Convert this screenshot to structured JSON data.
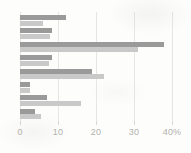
{
  "chart_data": {
    "type": "bar",
    "orientation": "horizontal",
    "title": "",
    "subtitle": "",
    "xlabel": "",
    "ylabel": "",
    "xlim": [
      0,
      40
    ],
    "grid": true,
    "grid_axis": "x",
    "legend": false,
    "legend_position": "none",
    "categories": [
      "1",
      "2",
      "3",
      "4",
      "5",
      "6",
      "7",
      "8"
    ],
    "tick_labels": [
      "0",
      "10",
      "20",
      "30",
      "40%"
    ],
    "tick_values": [
      0,
      10,
      20,
      30,
      40
    ],
    "series": [
      {
        "name": "Series 1",
        "color": "#9a9a9a",
        "values": [
          12,
          8.5,
          38,
          8.5,
          19,
          2.5,
          7,
          4
        ]
      },
      {
        "name": "Series 2",
        "color": "#c9c9c9",
        "values": [
          6,
          8,
          31,
          7.5,
          22,
          2.5,
          16,
          5.5
        ]
      }
    ]
  },
  "axis": {
    "unit_suffix": "%",
    "zero_px": 20,
    "max_px": 172
  }
}
